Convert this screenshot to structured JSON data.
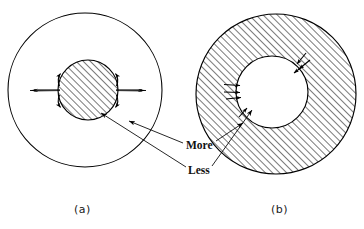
{
  "figure": {
    "title": "",
    "background_color": "#ffffff",
    "ink_color": "#000000",
    "panels": [
      {
        "id": "panel-a",
        "caption": "(a)",
        "outer_circle": {
          "cx": 85,
          "cy": 90,
          "r": 77,
          "fill": "none",
          "stroke": "#000000"
        },
        "inner_circle": {
          "cx": 88,
          "cy": 90,
          "r": 30,
          "fill": "hatch",
          "stroke": "#000000"
        },
        "hatch_angle_deg": 45,
        "arrow_direction": "outward",
        "arrow_count": 6
      },
      {
        "id": "panel-b",
        "caption": "(b)",
        "outer_circle": {
          "cx": 276,
          "cy": 94,
          "r": 80,
          "fill": "hatch",
          "stroke": "#000000"
        },
        "inner_circle": {
          "cx": 272,
          "cy": 92,
          "r": 36,
          "fill": "none",
          "stroke": "#000000"
        },
        "hatch_angle_deg": 45,
        "arrow_direction": "inward",
        "arrow_count": 6
      }
    ],
    "labels": [
      {
        "id": "more",
        "text": "More",
        "x": 186,
        "y": 139
      },
      {
        "id": "less",
        "text": "Less",
        "x": 188,
        "y": 164
      }
    ]
  }
}
